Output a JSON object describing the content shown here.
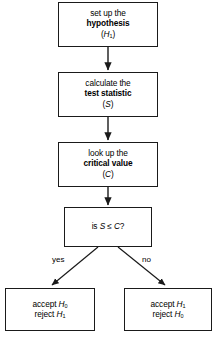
{
  "diagram": {
    "background_color": "#ffffff",
    "line_color": "#1a1a1a",
    "nodes": [
      {
        "id": "hypothesis",
        "shape": "rect",
        "lines": [
          "set up the",
          "hypothesis",
          "(H₁)"
        ],
        "line1": "set up the",
        "line2": "hypothesis",
        "line3": "(H1)"
      },
      {
        "id": "statistic",
        "shape": "rect",
        "lines": [
          "calculate the",
          "test statistic",
          "(S)"
        ],
        "line1": "calculate the",
        "line2": "test statistic",
        "line3": "(S)"
      },
      {
        "id": "critical",
        "shape": "rect",
        "lines": [
          "look up the",
          "critical value",
          "(C)"
        ],
        "line1": "look up the",
        "line2": "critical value",
        "line3": "(C)"
      },
      {
        "id": "decision",
        "shape": "rect",
        "lines": [
          "is S ≤ C?"
        ],
        "line1": "is S ≤ C?"
      },
      {
        "id": "accept-h0",
        "shape": "rect",
        "lines": [
          "accept H₀",
          "reject H₁"
        ],
        "line1": "accept H0",
        "line2": "reject H1"
      },
      {
        "id": "accept-h1",
        "shape": "rect",
        "lines": [
          "accept H₁",
          "reject H₀"
        ],
        "line1": "accept H1",
        "line2": "reject H0"
      }
    ],
    "edges": [
      {
        "id": "e1",
        "from": "hypothesis",
        "to": "statistic",
        "label": ""
      },
      {
        "id": "e2",
        "from": "statistic",
        "to": "critical",
        "label": ""
      },
      {
        "id": "e3",
        "from": "critical",
        "to": "decision",
        "label": ""
      },
      {
        "id": "e4",
        "from": "decision",
        "to": "accept-h0",
        "label": "yes"
      },
      {
        "id": "e5",
        "from": "decision",
        "to": "accept-h1",
        "label": "no"
      }
    ],
    "labels": {
      "yes": "yes",
      "no": "no"
    }
  }
}
